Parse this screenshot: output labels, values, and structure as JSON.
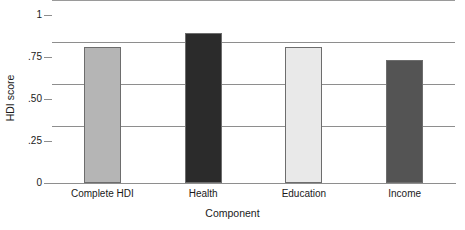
{
  "chart_data": {
    "type": "bar",
    "title": "",
    "xlabel": "Component",
    "ylabel": "HDI score",
    "categories": [
      "Complete HDI",
      "Health",
      "Education",
      "Income"
    ],
    "values": [
      0.81,
      0.89,
      0.81,
      0.73
    ],
    "bar_colors": [
      "#b5b5b5",
      "#2b2b2b",
      "#e9e9e9",
      "#545454"
    ],
    "bar_border_color": "#6d6d6d",
    "ylim": [
      0,
      1
    ],
    "yticks": [
      0,
      0.25,
      0.5,
      0.75,
      1
    ],
    "ytick_labels": [
      "0",
      ".25",
      ".50",
      ".75",
      "1"
    ],
    "grid": "horizontal",
    "grid_color": "#8e8e8e",
    "legend": "none",
    "background": "#ffffff"
  },
  "axes": {
    "y_title": "HDI score",
    "x_title": "Component"
  }
}
